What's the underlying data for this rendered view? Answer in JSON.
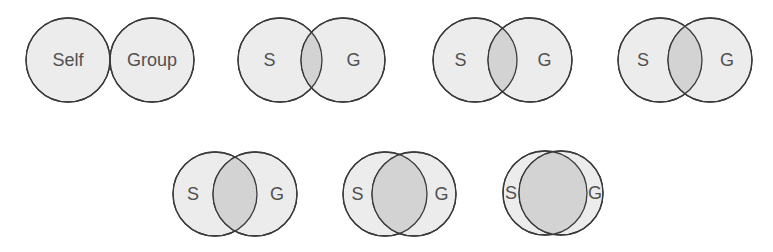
{
  "diagram": {
    "type": "venn-sequence",
    "fill_color": "#ececec",
    "overlap_color": "#d3d3d3",
    "stroke_color": "#3a3a3a",
    "text_color": "#505050",
    "radius": 42,
    "pairs": [
      {
        "left_label": "Self",
        "right_label": "Group",
        "left_cx": 68,
        "right_cx": 152,
        "cy": 60
      },
      {
        "left_label": "S",
        "right_label": "G",
        "left_cx": 280,
        "right_cx": 343,
        "cy": 60
      },
      {
        "left_label": "S",
        "right_label": "G",
        "left_cx": 475,
        "right_cx": 530,
        "cy": 60
      },
      {
        "left_label": "S",
        "right_label": "G",
        "left_cx": 660,
        "right_cx": 710,
        "cy": 60
      },
      {
        "left_label": "S",
        "right_label": "G",
        "left_cx": 215,
        "right_cx": 255,
        "cy": 194
      },
      {
        "left_label": "S",
        "right_label": "G",
        "left_cx": 385,
        "right_cx": 414,
        "cy": 194
      },
      {
        "left_label": "S",
        "right_label": "G",
        "left_cx": 545,
        "right_cx": 561,
        "cy": 193
      }
    ]
  }
}
